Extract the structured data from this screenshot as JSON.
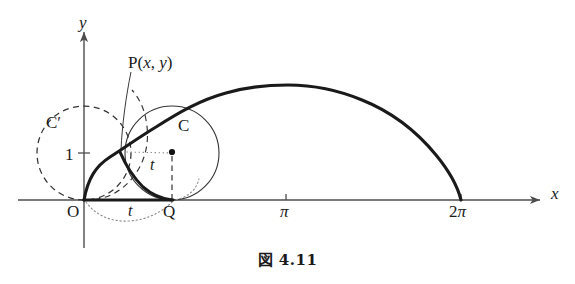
{
  "figure": {
    "caption": "図 4.11",
    "axes": {
      "x_axis_label": "x",
      "y_axis_label": "y",
      "x_ticks": [
        {
          "label": "π",
          "value": 3.14159
        },
        {
          "label": "2π",
          "value": 6.28319
        }
      ],
      "y_ticks": [
        {
          "label": "1",
          "value": 1
        }
      ],
      "origin_label": "O",
      "x_range": [
        -1.25,
        7.4
      ],
      "y_range": [
        -0.55,
        3.1
      ],
      "grid": false
    },
    "points": {
      "P": {
        "label": "P(x, y)",
        "label_function": "P",
        "label_args": "(x, y)"
      },
      "Q": {
        "label": "Q"
      },
      "C": {
        "label": "C"
      },
      "C_prime": {
        "label": "C′",
        "base": "C",
        "prime": "′"
      }
    },
    "angles": {
      "t_upper": "t",
      "t_lower": "t"
    },
    "colors": {
      "curve": "#1a1a1a",
      "axis": "#4d4d4d",
      "circle": "#333333",
      "dashed": "#333333",
      "dotted": "#808080",
      "background": "#ffffff"
    }
  },
  "chart_data": {
    "type": "line",
    "title": "図 4.11",
    "xlabel": "x",
    "ylabel": "y",
    "xlim": [
      -1.25,
      7.4
    ],
    "ylim": [
      -0.55,
      3.1
    ],
    "grid": false,
    "legend": null,
    "series": [
      {
        "name": "cycloid arch",
        "style": "solid-thick",
        "parametric": "x = t - sin t,  y = 1 - cos t,  t in [0, 2π]",
        "x": [
          0.0,
          0.02,
          0.16,
          0.52,
          1.23,
          2.28,
          3.14,
          4.0,
          5.05,
          5.76,
          6.12,
          6.26,
          6.28
        ],
        "y": [
          0.0,
          0.09,
          0.29,
          0.59,
          1.0,
          1.59,
          2.0,
          1.59,
          1.0,
          0.59,
          0.29,
          0.09,
          0.0
        ]
      },
      {
        "name": "generating arc P to Q",
        "style": "solid-thick",
        "x": [
          0.72,
          0.95,
          1.28,
          1.6,
          1.78,
          1.83
        ],
        "y": [
          1.0,
          0.78,
          0.48,
          0.22,
          0.06,
          0.0
        ]
      },
      {
        "name": "chord O to P",
        "style": "solid-thick",
        "x": [
          0.0,
          0.72
        ],
        "y": [
          0.0,
          1.0
        ]
      },
      {
        "name": "circle C (rolling circle at Q)",
        "style": "solid-thin",
        "center": [
          1.83,
          1.0
        ],
        "radius": 1.0
      },
      {
        "name": "circle C' (initial circle at O)",
        "style": "dashed",
        "center": [
          0.0,
          1.0
        ],
        "radius": 1.0
      },
      {
        "name": "segment O-Q on axis",
        "style": "solid-thick",
        "x": [
          0.0,
          1.83
        ],
        "y": [
          0.0,
          0.0
        ]
      }
    ],
    "annotations": [
      {
        "text": "P(x, y)",
        "x": 0.72,
        "y": 1.0
      },
      {
        "text": "Q",
        "x": 1.83,
        "y": 0.0
      },
      {
        "text": "C",
        "x": 1.83,
        "y": 1.0
      },
      {
        "text": "C′",
        "x": 0.0,
        "y": 1.0
      },
      {
        "text": "t",
        "x": 1.4,
        "y": 0.62
      },
      {
        "text": "t",
        "x": 0.85,
        "y": -0.3
      },
      {
        "text": "O",
        "x": 0.0,
        "y": 0.0
      },
      {
        "text": "π",
        "x": 3.14159,
        "y": 0.0
      },
      {
        "text": "2π",
        "x": 6.28319,
        "y": 0.0
      }
    ]
  }
}
